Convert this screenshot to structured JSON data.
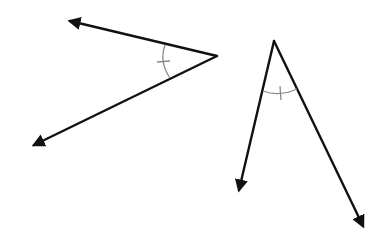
{
  "diagram": {
    "title": "",
    "colors": {
      "ray": "#111111",
      "arc_mark": "#8a8a8a",
      "background": "#ffffff"
    },
    "angles": [
      {
        "id": "angle-left",
        "congruence_marks": 1,
        "opening": "left"
      },
      {
        "id": "angle-right",
        "congruence_marks": 1,
        "opening": "down"
      }
    ],
    "relationship": "congruent"
  }
}
